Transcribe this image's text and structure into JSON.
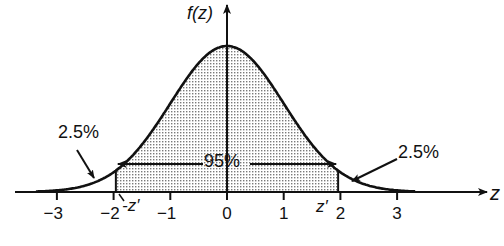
{
  "diagram": {
    "type": "normal-distribution",
    "y_axis_label": "f(z)",
    "x_axis_label": "z",
    "x_ticks": [
      {
        "value": -3,
        "label": "−3"
      },
      {
        "value": -2,
        "label": "−2"
      },
      {
        "value": -1,
        "label": "−1"
      },
      {
        "value": 0,
        "label": "0"
      },
      {
        "value": 1,
        "label": "1"
      },
      {
        "value": 2,
        "label": "2"
      },
      {
        "value": 3,
        "label": "3"
      }
    ],
    "x_range": [
      -3.7,
      3.3
    ],
    "critical_value": 1.96,
    "lower_critical_label": "-z′",
    "upper_critical_label": "z′",
    "central_area_label": "95%",
    "left_tail_label": "2.5%",
    "right_tail_label": "2.5%",
    "colors": {
      "ink": "#111111",
      "shading": "#8a8a8a",
      "background": "#ffffff"
    }
  }
}
